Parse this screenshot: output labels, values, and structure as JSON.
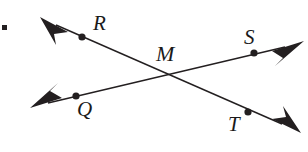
{
  "figure": {
    "name": "two-intersecting-lines-diagram",
    "stroke_color": "#231f20",
    "background_color": "#ffffff",
    "stroke_width": 1.4,
    "point_radius": 3.6,
    "bullet_marker": {
      "x": 3,
      "y": 26,
      "size": 5,
      "name": "list-bullet-square"
    }
  },
  "points": [
    {
      "id": "R",
      "label": "R",
      "x": 82,
      "y": 37,
      "label_x": 93,
      "label_y": 13
    },
    {
      "id": "S",
      "label": "S",
      "x": 254,
      "y": 53,
      "label_x": 244,
      "label_y": 27
    },
    {
      "id": "M",
      "label": "M",
      "x": 163,
      "y": 75,
      "label_x": 156,
      "label_y": 43
    },
    {
      "id": "Q",
      "label": "Q",
      "x": 76,
      "y": 96,
      "label_x": 77,
      "label_y": 99
    },
    {
      "id": "T",
      "label": "T",
      "x": 248,
      "y": 112,
      "label_x": 228,
      "label_y": 114
    }
  ],
  "lines": [
    {
      "id": "line-RT",
      "name": "line-through-R-M-T",
      "through": [
        "R",
        "M",
        "T"
      ],
      "start": {
        "x": 56,
        "y": 25
      },
      "end": {
        "x": 282,
        "y": 124
      },
      "arrow_start": {
        "x": 40,
        "y": 18,
        "name": "arrowhead-upper-left"
      },
      "arrow_end": {
        "x": 300,
        "y": 132,
        "name": "arrowhead-lower-right"
      }
    },
    {
      "id": "line-QS",
      "name": "line-through-Q-M-S",
      "through": [
        "Q",
        "M",
        "S"
      ],
      "start": {
        "x": 48,
        "y": 103
      },
      "end": {
        "x": 284,
        "y": 47
      },
      "arrow_start": {
        "x": 31,
        "y": 107,
        "name": "arrowhead-lower-left"
      },
      "arrow_end": {
        "x": 303,
        "y": 42,
        "name": "arrowhead-upper-right"
      }
    }
  ]
}
